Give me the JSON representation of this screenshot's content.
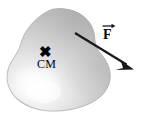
{
  "figure": {
    "background_color": "#ffffff",
    "width": 141,
    "height": 124
  },
  "body_shape": {
    "name": "irregular-blob",
    "description": "amoeba-like closed blob with two rounded lobes and a concave notch on the upper right",
    "fill_light": "#fdfdfd",
    "fill_mid": "#d8d8d8",
    "fill_dark": "#b2b2b2",
    "outline_color": "#9a9a9a"
  },
  "center_of_mass": {
    "marker_glyph": "✖",
    "label": "CM",
    "marker_color": "#000000",
    "label_color": "#000000"
  },
  "force_vector": {
    "label": "F",
    "accent": "vector-arrow-overbar",
    "color": "#1a1a1a",
    "tail": {
      "x": 75,
      "y": 33
    },
    "tip": {
      "x": 132,
      "y": 68
    }
  }
}
